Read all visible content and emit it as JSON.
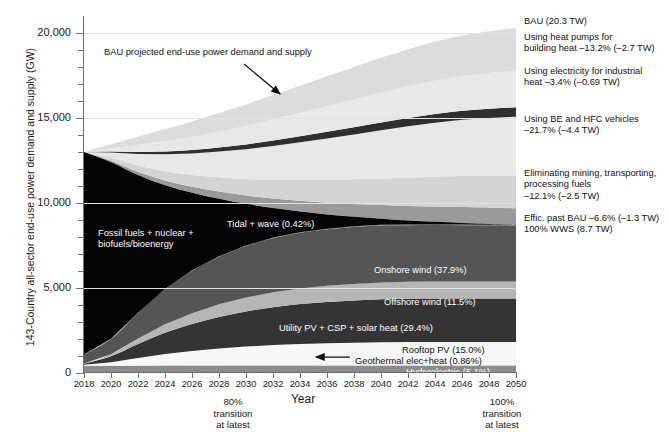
{
  "axis": {
    "ylabel": "143-Country all-sector end-use power demand and supply (GW)",
    "xlabel": "Year",
    "yticks": [
      "0",
      "5,000",
      "10,000",
      "15,000",
      "20,000"
    ],
    "xticks": [
      "2018",
      "2020",
      "2022",
      "2024",
      "2026",
      "2028",
      "2030",
      "2032",
      "2034",
      "2036",
      "2038",
      "2040",
      "2042",
      "2044",
      "2046",
      "2048",
      "2050"
    ]
  },
  "annotations": {
    "bau_note": "BAU projected end-use power demand and supply",
    "transition_80": "80%\ntransition\nat latest",
    "transition_80_l1": "80%",
    "transition_80_l2": "transition",
    "transition_80_l3": "at latest",
    "transition_100_l1": "100%",
    "transition_100_l2": "transition",
    "transition_100_l3": "at latest"
  },
  "inchart_labels": [
    {
      "name": "fossil-fuels-label",
      "line1": "Fossil fuels + nuclear +",
      "line2": "biofuels/bioenergy"
    },
    {
      "name": "tidal-wave-label",
      "text": "Tidal + wave (0.42%)"
    },
    {
      "name": "onshore-wind-label",
      "text": "Onshore wind (37.9%)"
    },
    {
      "name": "offshore-wind-label",
      "text": "Offshore wind (11.5%)"
    },
    {
      "name": "utility-pv-label",
      "text": "Utility PV + CSP + solar heat (29.4%)"
    },
    {
      "name": "rooftop-pv-label",
      "text": "Rooftop PV (15.0%)"
    },
    {
      "name": "geothermal-label",
      "text": "Geothermal elec+heat (0.86%)"
    },
    {
      "name": "hydroelectric-label",
      "text": "Hydroelectric (5.1%)"
    }
  ],
  "callouts": [
    {
      "name": "callout-bau",
      "line1": "BAU (20.3 TW)",
      "line2": ""
    },
    {
      "name": "callout-heat-pumps",
      "line1": "Using heat pumps for",
      "line2": "building heat –13.2% (–2.7 TW)"
    },
    {
      "name": "callout-industrial-heat",
      "line1": "Using electricity for industrial",
      "line2": "heat –3.4% (–0.69 TW)"
    },
    {
      "name": "callout-vehicles",
      "line1": "Using BE and HFC vehicles",
      "line2": "–21.7% (–4.4 TW)"
    },
    {
      "name": "callout-mining",
      "line1": "Eliminating mining, transporting,",
      "line2": "processing fuels",
      "line3": "–12.1% (–2.5 TW)"
    },
    {
      "name": "callout-efficiency",
      "line1": "Effic. past BAU –6.6% (–1.3 TW)",
      "line2": "100% WWS (8.7 TW)"
    }
  ],
  "chart_data": {
    "type": "area",
    "title": "",
    "xlabel": "Year",
    "ylabel": "143-Country all-sector end-use power demand and supply (GW)",
    "xlim": [
      2018,
      2050
    ],
    "ylim": [
      0,
      21000
    ],
    "ytick_values": [
      0,
      5000,
      10000,
      15000,
      20000
    ],
    "grid": "horizontal-major",
    "legend": "inline-labels",
    "x": [
      2018,
      2020,
      2022,
      2024,
      2026,
      2028,
      2030,
      2032,
      2034,
      2036,
      2038,
      2040,
      2042,
      2044,
      2046,
      2048,
      2050
    ],
    "bau_total": [
      13000,
      13450,
      13900,
      14350,
      14800,
      15300,
      15800,
      16350,
      16900,
      17450,
      18000,
      18550,
      19050,
      19500,
      19850,
      20100,
      20300
    ],
    "wws_total": [
      13000,
      12400,
      11650,
      11050,
      10600,
      10250,
      9950,
      9700,
      9500,
      9330,
      9190,
      9070,
      8970,
      8890,
      8830,
      8770,
      8700
    ],
    "series": [
      {
        "name": "Hydroelectric",
        "share_pct": 5.1,
        "color": "#8c8c8c",
        "values": [
          430,
          430,
          432,
          435,
          437,
          440,
          441,
          442,
          443,
          444,
          444,
          445,
          445,
          446,
          446,
          446,
          446
        ]
      },
      {
        "name": "Geothermal elec+heat",
        "share_pct": 0.86,
        "color": "#f2f2f2",
        "values": [
          20,
          25,
          31,
          37,
          42,
          48,
          53,
          58,
          62,
          65,
          68,
          70,
          72,
          73,
          74,
          74,
          75
        ]
      },
      {
        "name": "Rooftop PV",
        "share_pct": 15.0,
        "color": "#f7f7f7",
        "values": [
          30,
          180,
          420,
          640,
          810,
          950,
          1060,
          1140,
          1200,
          1240,
          1270,
          1290,
          1300,
          1305,
          1305,
          1305,
          1305
        ]
      },
      {
        "name": "Utility PV + CSP + solar heat",
        "share_pct": 29.4,
        "color": "#343434",
        "values": [
          60,
          350,
          830,
          1260,
          1590,
          1860,
          2070,
          2230,
          2350,
          2430,
          2490,
          2530,
          2550,
          2560,
          2560,
          2560,
          2558
        ]
      },
      {
        "name": "Offshore wind",
        "share_pct": 11.5,
        "color": "#b6b6b6",
        "values": [
          12,
          120,
          320,
          500,
          640,
          740,
          820,
          880,
          920,
          950,
          970,
          985,
          995,
          1000,
          1000,
          1000,
          1000
        ]
      },
      {
        "name": "Onshore wind",
        "share_pct": 37.9,
        "color": "#555555",
        "values": [
          540,
          900,
          1500,
          2050,
          2500,
          2800,
          3030,
          3190,
          3280,
          3330,
          3350,
          3360,
          3330,
          3320,
          3310,
          3300,
          3298
        ]
      },
      {
        "name": "Tidal + wave",
        "share_pct": 0.42,
        "color": "#7a7a7a",
        "values": [
          1,
          4,
          9,
          14,
          19,
          23,
          26,
          29,
          31,
          33,
          34,
          35,
          36,
          36,
          36,
          36,
          37
        ]
      },
      {
        "name": "Fossil fuels + nuclear + biofuels/bioenergy",
        "share_pct": 0,
        "color": "#050505",
        "values": [
          11907,
          10391,
          8108,
          6114,
          4562,
          3389,
          2450,
          1731,
          1214,
          838,
          564,
          355,
          242,
          150,
          99,
          49,
          0
        ]
      }
    ],
    "bau_bands": [
      {
        "name": "Effic. past BAU",
        "pct": -6.6,
        "tw": -1.3,
        "color": "#9a9a9a"
      },
      {
        "name": "Eliminating mining, transporting, processing fuels",
        "pct": -12.1,
        "tw": -2.5,
        "color": "#d4d4d4"
      },
      {
        "name": "Using BE and HFC vehicles",
        "pct": -21.7,
        "tw": -4.4,
        "color": "#e8e8e8"
      },
      {
        "name": "Using electricity for industrial heat",
        "pct": -3.4,
        "tw": -0.69,
        "color": "#2f2f2f"
      },
      {
        "name": "Using heat pumps for building heat",
        "pct": -13.2,
        "tw": -2.7,
        "color": "#e8e8e8"
      },
      {
        "name": "BAU",
        "pct": 100,
        "tw": 20.3,
        "color": "#dcdcdc"
      }
    ],
    "endpoints": {
      "bau_2050_tw": 20.3,
      "wws_2050_tw": 8.7
    }
  }
}
